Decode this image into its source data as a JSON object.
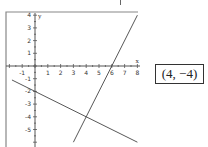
{
  "answer": "(4, −4)",
  "chart_data": {
    "type": "line",
    "title": "",
    "xlabel": "x",
    "ylabel": "y",
    "xlim": [
      -1.8,
      8
    ],
    "ylim": [
      -6,
      4.2
    ],
    "x_ticks": [
      -1,
      1,
      2,
      3,
      4,
      5,
      6,
      7,
      8
    ],
    "y_ticks": [
      4,
      3,
      2,
      1,
      -1,
      -2,
      -3,
      -4,
      -5
    ],
    "grid": false,
    "legend": null,
    "series": [
      {
        "name": "y = 2x - 12",
        "points": [
          [
            3,
            -6
          ],
          [
            8,
            4
          ]
        ]
      },
      {
        "name": "y = -x/2 - 2",
        "points": [
          [
            -1.8,
            -1.1
          ],
          [
            8,
            -6
          ]
        ]
      }
    ],
    "annotations": [
      {
        "text": "(4, -4)",
        "note": "intersection point"
      }
    ]
  }
}
